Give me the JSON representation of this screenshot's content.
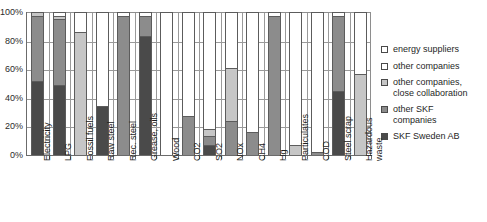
{
  "chart_data": {
    "type": "bar",
    "stacked": true,
    "title": "",
    "subtitle": "",
    "xlabel": "",
    "ylabel": "",
    "ylim": [
      0,
      100
    ],
    "yticks": [
      "0%",
      "20%",
      "40%",
      "60%",
      "80%",
      "100%"
    ],
    "ytick_values": [
      0,
      20,
      40,
      60,
      80,
      100
    ],
    "grid": true,
    "legend_position": "right",
    "unit": "%",
    "categories": [
      "Electricity",
      "LPG",
      "Fossil fuels",
      "Raw steel",
      "Rec. steel",
      "Grease, oils",
      "Wood",
      "CO2",
      "SO2",
      "NOx",
      "CH4",
      "Hg",
      "Particulates",
      "COD",
      "Steel scrap",
      "Hazardous\nwaste"
    ],
    "series": [
      {
        "name": "SKF Sweden AB",
        "color": "#4a4a4a",
        "values": [
          52,
          49,
          0,
          34,
          0,
          83,
          0,
          0,
          7,
          0,
          0,
          0,
          0,
          0,
          45,
          0
        ]
      },
      {
        "name": "other SKF companies",
        "color": "#8c8c8c",
        "values": [
          45,
          46,
          0,
          0,
          97,
          14,
          0,
          27,
          6,
          24,
          16,
          97,
          0,
          2,
          52,
          0
        ]
      },
      {
        "name": "other companies, close collaboration",
        "color": "#c6c6c6",
        "values": [
          3,
          2,
          86,
          0,
          0,
          0,
          0,
          0,
          5,
          37,
          0,
          0,
          7,
          0,
          0,
          57
        ]
      },
      {
        "name": "other companies",
        "color": "#ffffff",
        "values": [
          0,
          3,
          14,
          66,
          3,
          3,
          100,
          73,
          82,
          39,
          84,
          3,
          93,
          98,
          3,
          43
        ]
      },
      {
        "name": "energy suppliers",
        "color": "#ffffff",
        "values": [
          0,
          0,
          0,
          0,
          0,
          0,
          0,
          0,
          0,
          0,
          0,
          0,
          0,
          0,
          0,
          0
        ]
      }
    ]
  },
  "legend": {
    "items": [
      {
        "label": "energy suppliers",
        "color": "#ffffff"
      },
      {
        "label": "other companies",
        "color": "#ffffff"
      },
      {
        "label": "other companies,\nclose collaboration",
        "color": "#c6c6c6"
      },
      {
        "label": "other SKF\ncompanies",
        "color": "#8c8c8c"
      },
      {
        "label": "SKF Sweden AB",
        "color": "#4a4a4a"
      }
    ]
  }
}
